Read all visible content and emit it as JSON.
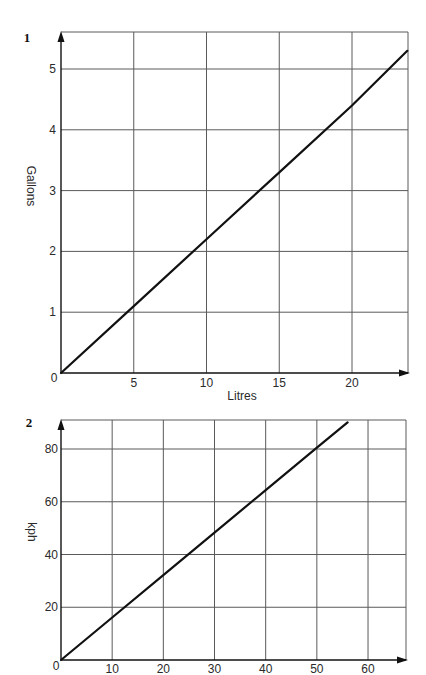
{
  "colors": {
    "background": "#ffffff",
    "grid": "#5a5a5a",
    "axis": "#111111",
    "series_line": "#111111",
    "text": "#2a2a2a"
  },
  "chart_data": [
    {
      "label": "1",
      "type": "line",
      "title": "",
      "xlabel": "Litres",
      "ylabel": "Gallons",
      "origin_label": "0",
      "x_ticks": [
        5,
        10,
        15,
        20
      ],
      "y_ticks": [
        1,
        2,
        3,
        4,
        5
      ],
      "xlim": [
        0,
        23.85
      ],
      "ylim": [
        0,
        5.61
      ],
      "grid": true,
      "legend": null,
      "series": [
        {
          "name": "Gallons vs Litres",
          "x": [
            0,
            5,
            10,
            15,
            20,
            23.8
          ],
          "y": [
            0,
            1.1,
            2.2,
            3.3,
            4.4,
            5.3
          ]
        }
      ]
    },
    {
      "label": "2",
      "type": "line",
      "title": "",
      "xlabel": "",
      "ylabel": "kph",
      "origin_label": "0",
      "x_ticks": [
        10,
        20,
        30,
        40,
        50,
        60
      ],
      "y_ticks": [
        20,
        40,
        60,
        80
      ],
      "xlim": [
        0,
        67.4
      ],
      "ylim": [
        0,
        91
      ],
      "grid": true,
      "legend": null,
      "series": [
        {
          "name": "kph",
          "x": [
            0,
            10,
            20,
            30,
            40,
            50,
            56
          ],
          "y": [
            0,
            16.1,
            32.2,
            48.3,
            64.4,
            80.5,
            90.1
          ]
        }
      ]
    }
  ]
}
